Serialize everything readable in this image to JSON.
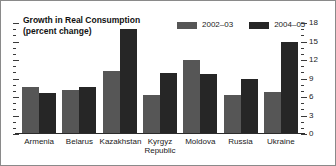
{
  "chart_data": {
    "type": "bar",
    "title": "Growth in Real Consumption\n(percent change)",
    "title_line1": "Growth in Real Consumption",
    "title_line2": "(percent change)",
    "xlabel": "",
    "ylabel": "",
    "ylim": [
      0,
      18
    ],
    "yticks": [
      0,
      3,
      6,
      9,
      12,
      15,
      18
    ],
    "ytick_labels": [
      "0",
      "3",
      "6",
      "9",
      "12",
      "15",
      "18"
    ],
    "minor_tick_step": 1,
    "axis_position": "right",
    "grid": false,
    "legend_position": "top-right",
    "categories": [
      "Armenia",
      "Belarus",
      "Kazakhstan",
      "Kyrgyz Republic",
      "Moldova",
      "Russia",
      "Ukraine"
    ],
    "category_labels": [
      "Armenia",
      "Belarus",
      "Kazakhstan",
      "Kyrgyz\nRepublic",
      "Moldova",
      "Russia",
      "Ukraine"
    ],
    "series": [
      {
        "name": "2002–03",
        "color": "#565656",
        "values": [
          7.6,
          7.1,
          10.2,
          6.3,
          12.0,
          6.3,
          6.8
        ]
      },
      {
        "name": "2004–05",
        "color": "#262626",
        "values": [
          6.6,
          7.6,
          17.0,
          9.9,
          9.7,
          8.9,
          15.0
        ]
      }
    ]
  },
  "colors": {
    "series_2002_03": "#565656",
    "series_2004_05": "#262626",
    "axis": "#2b2b2b",
    "border": "#8a8a8a",
    "text": "#1a1a1a",
    "background": "#ffffff"
  }
}
